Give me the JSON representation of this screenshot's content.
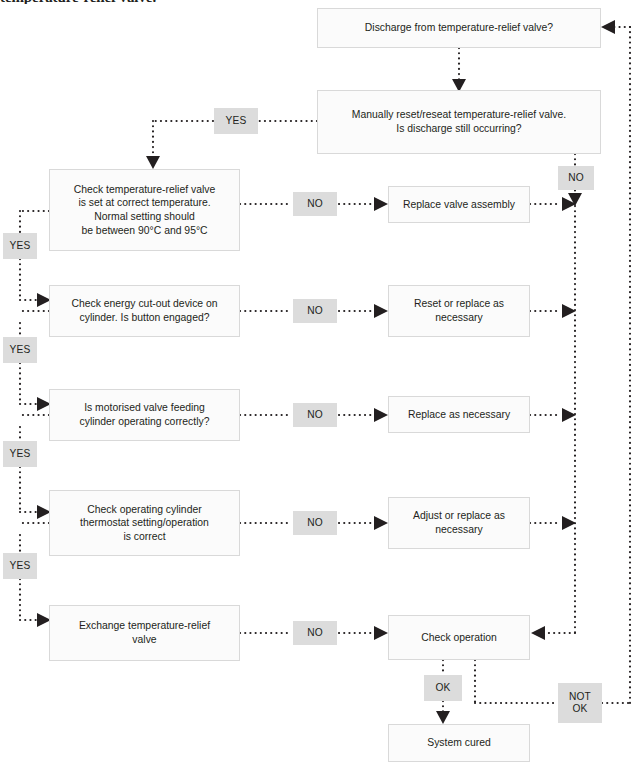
{
  "heading": {
    "partial_text": "temperature-relief valve."
  },
  "diagram": {
    "nodes": {
      "discharge_question": "Discharge from temperature-relief valve?",
      "manual_reset": "Manually reset/reseat temperature-relief valve.\nIs discharge still occurring?",
      "check_trv_temp": "Check temperature-relief valve\nis set at correct temperature.\nNormal setting should\nbe between 90°C and 95°C",
      "check_energy_cutout": "Check energy cut-out device on\ncylinder. Is button engaged?",
      "check_motorised_valve": "Is motorised valve feeding\ncylinder operating correctly?",
      "check_thermostat": "Check operating cylinder\nthermostat setting/operation\nis correct",
      "exchange_trv": "Exchange temperature-relief\nvalve",
      "replace_valve_assembly": "Replace valve assembly",
      "reset_or_replace": "Reset or replace as\nnecessary",
      "replace_as_necessary": "Replace as necessary",
      "adjust_or_replace": "Adjust or replace as\nnecessary",
      "check_operation": "Check operation",
      "system_cured": "System cured"
    },
    "labels": {
      "yes_top": "YES",
      "yes_1": "YES",
      "yes_2": "YES",
      "yes_3": "YES",
      "yes_4": "YES",
      "no_1": "NO",
      "no_2": "NO",
      "no_3": "NO",
      "no_4": "NO",
      "no_5": "NO",
      "no_right": "NO",
      "ok": "OK",
      "not_ok": "NOT\nOK"
    },
    "colors": {
      "node_fill": "#fbfbfb",
      "node_border": "#d9d9d9",
      "badge_fill": "#dcdcdc",
      "line": "#231f20",
      "text": "#231f20",
      "background": "#ffffff"
    }
  }
}
